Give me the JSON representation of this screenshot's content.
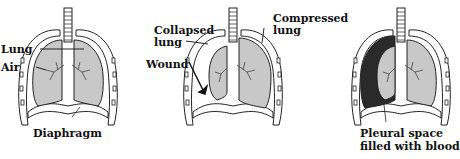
{
  "panels": [
    {
      "name": "normal",
      "labels": {
        "lung": "Lung",
        "air": "Air",
        "diaphragm": "Diaphragm"
      }
    },
    {
      "name": "pneumothorax",
      "labels": {
        "collapsed_line1": "Collapsed",
        "collapsed_line2": "lung",
        "compressed_line1": "Compressed",
        "compressed_line2": "lung",
        "wound": "Wound"
      }
    },
    {
      "name": "hemothorax",
      "labels": {
        "pleural_line1": "Pleural space",
        "pleural_line2": "filled with blood"
      }
    }
  ],
  "colors": {
    "lung_fill": "#c8c8c8",
    "blood_fill": "#2a2a2a",
    "outline": "#222222"
  }
}
